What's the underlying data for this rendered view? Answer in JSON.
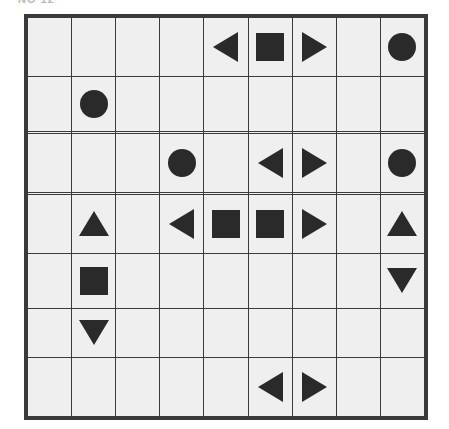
{
  "caption": {
    "text": "NO 12",
    "note": "partially clipped at top edge"
  },
  "colors": {
    "shape_fill": "#2a2a2a",
    "cell_background": "#efefef",
    "grid_line": "#3a3a3a",
    "page_background": "#ffffff"
  },
  "grid": {
    "rows": 9,
    "columns": 9,
    "shape_names": {
      "square": "square-icon",
      "circle": "circle-icon",
      "triangle-left": "triangle-left-icon",
      "triangle-right": "triangle-right-icon",
      "triangle-up": "triangle-up-icon",
      "triangle-down": "triangle-down-icon",
      "empty": "empty-cell"
    },
    "cells": [
      [
        "empty",
        "empty",
        "empty",
        "empty",
        "triangle-left",
        "square",
        "triangle-right",
        "empty",
        "circle"
      ],
      [
        "empty",
        "circle",
        "empty",
        "empty",
        "empty",
        "empty",
        "empty",
        "empty",
        "empty"
      ],
      [
        "empty",
        "empty",
        "empty",
        "empty",
        "empty",
        "empty",
        "empty",
        "empty",
        "empty"
      ],
      [
        "empty",
        "empty",
        "empty",
        "circle",
        "empty",
        "triangle-left",
        "triangle-right",
        "empty",
        "circle"
      ],
      [
        "empty",
        "empty",
        "empty",
        "empty",
        "empty",
        "empty",
        "empty",
        "empty",
        "empty"
      ],
      [
        "empty",
        "triangle-up",
        "empty",
        "triangle-left",
        "square",
        "square",
        "triangle-right",
        "empty",
        "triangle-up"
      ],
      [
        "empty",
        "square",
        "empty",
        "empty",
        "empty",
        "empty",
        "empty",
        "empty",
        "triangle-down"
      ],
      [
        "empty",
        "triangle-down",
        "empty",
        "empty",
        "empty",
        "empty",
        "empty",
        "empty",
        "empty"
      ],
      [
        "empty",
        "empty",
        "empty",
        "empty",
        "empty",
        "triangle-left",
        "triangle-right",
        "empty",
        "empty"
      ]
    ]
  }
}
